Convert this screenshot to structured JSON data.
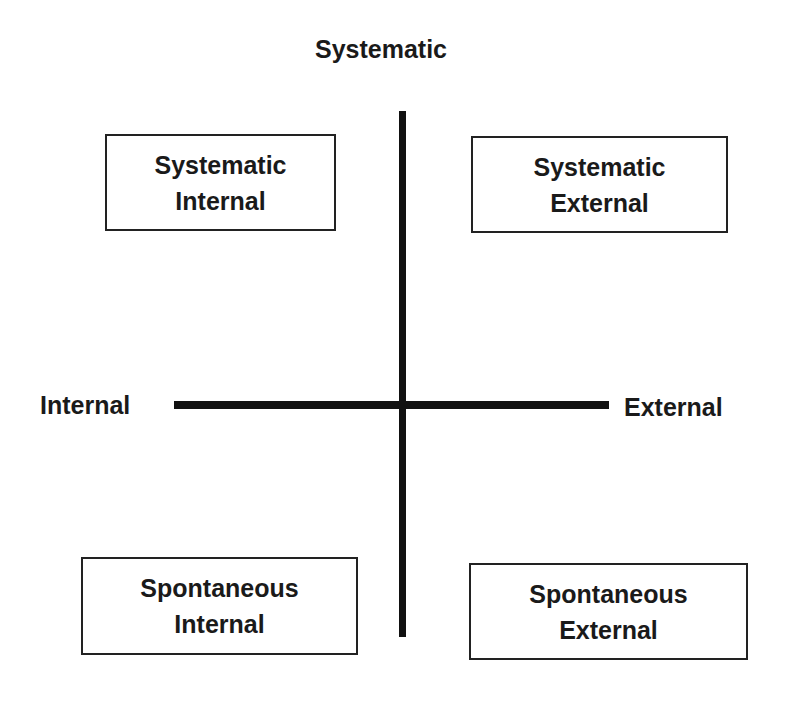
{
  "diagram": {
    "axes": {
      "top_label": "Systematic",
      "left_label": "Internal",
      "right_label": "External"
    },
    "quadrants": [
      {
        "position": "top-left",
        "line1": "Systematic",
        "line2": "Internal"
      },
      {
        "position": "top-right",
        "line1": "Systematic",
        "line2": "External"
      },
      {
        "position": "bottom-left",
        "line1": "Spontaneous",
        "line2": "Internal"
      },
      {
        "position": "bottom-right",
        "line1": "Spontaneous",
        "line2": "External"
      }
    ],
    "colors": {
      "line": "#111111",
      "text": "#1a1a1a",
      "background": "#ffffff"
    }
  }
}
